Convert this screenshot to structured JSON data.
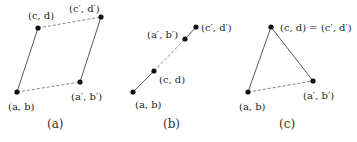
{
  "panels": [
    {
      "id": "a",
      "caption": "(a)",
      "points": [
        {
          "key": "ab",
          "label": "(a, b)"
        },
        {
          "key": "cd",
          "label": "(c, d)"
        },
        {
          "key": "apbp",
          "label": "(a′, b′)"
        },
        {
          "key": "cpdp",
          "label": "(c′, d′)"
        }
      ],
      "edges": [
        {
          "from": "ab",
          "to": "cd",
          "style": "solid"
        },
        {
          "from": "apbp",
          "to": "cpdp",
          "style": "solid"
        },
        {
          "from": "cd",
          "to": "cpdp",
          "style": "dashed"
        },
        {
          "from": "ab",
          "to": "apbp",
          "style": "dashed"
        }
      ]
    },
    {
      "id": "b",
      "caption": "(b)",
      "points": [
        {
          "key": "ab",
          "label": "(a, b)"
        },
        {
          "key": "cd",
          "label": "(c, d)"
        },
        {
          "key": "apbp",
          "label": "(a′, b′)"
        },
        {
          "key": "cpdp",
          "label": "(c′, d′)"
        }
      ],
      "edges": [
        {
          "from": "ab",
          "to": "cd",
          "style": "solid"
        },
        {
          "from": "apbp",
          "to": "cpdp",
          "style": "solid"
        },
        {
          "from": "cd",
          "to": "apbp",
          "style": "dashed"
        }
      ]
    },
    {
      "id": "c",
      "caption": "(c)",
      "points": [
        {
          "key": "ab",
          "label": "(a, b)"
        },
        {
          "key": "cd",
          "label": "(c, d) = (c′, d′)"
        },
        {
          "key": "apbp",
          "label": "(a′, b′)"
        }
      ],
      "edges": [
        {
          "from": "ab",
          "to": "cd",
          "style": "solid"
        },
        {
          "from": "apbp",
          "to": "cd",
          "style": "solid"
        },
        {
          "from": "ab",
          "to": "apbp",
          "style": "dashed"
        }
      ]
    }
  ]
}
